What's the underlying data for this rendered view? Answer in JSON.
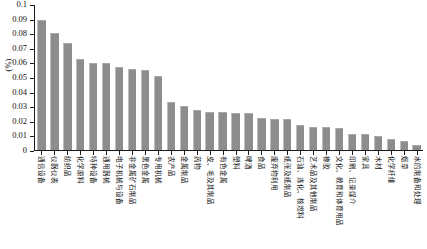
{
  "chart_data": {
    "type": "bar",
    "title": "",
    "subtitle": "",
    "xlabel": "",
    "ylabel": "(%)",
    "ylim": [
      0,
      0.1
    ],
    "ytick_labels": [
      "0.1",
      "0.09",
      "0.08",
      "0.07",
      "0.06",
      "0.05",
      "0.04",
      "0.03",
      "0.02",
      "0.01",
      "0"
    ],
    "ytick_values": [
      0.1,
      0.09,
      0.08,
      0.07,
      0.06,
      0.05,
      0.04,
      0.03,
      0.02,
      0.01,
      0
    ],
    "grid": false,
    "legend": null,
    "bar_color": "#8d8d8d",
    "axis_color": "#1a1a1a",
    "categories": [
      "通信设备",
      "仪器仪表",
      "纺织品",
      "化学原料",
      "特种设备",
      "通用器械",
      "电子机械与设备",
      "非金属矿石制品",
      "黑色金属",
      "专用机械",
      "农产品",
      "金属制品",
      "药物",
      "皮、毛及其制品",
      "有色金属",
      "塑料",
      "啤酒",
      "食品",
      "废弃物利用",
      "纸张及纸制品",
      "石油、炼化、核燃料",
      "艺术品及其他制品",
      "橡胶",
      "文化、教育和体育用品",
      "印刷、记录媒介",
      "家具",
      "木材",
      "化学纤维",
      "烟草",
      "水的制备和处理"
    ],
    "values": [
      0.0888,
      0.0799,
      0.0734,
      0.062,
      0.0595,
      0.059,
      0.0567,
      0.0554,
      0.0543,
      0.0506,
      0.0326,
      0.0298,
      0.0267,
      0.0255,
      0.0254,
      0.0248,
      0.0247,
      0.0213,
      0.0207,
      0.0205,
      0.0165,
      0.0154,
      0.0152,
      0.0146,
      0.0105,
      0.0101,
      0.0091,
      0.0071,
      0.0058,
      0.003
    ]
  }
}
